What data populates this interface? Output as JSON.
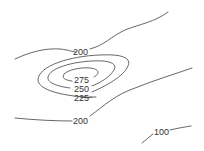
{
  "map": {
    "type": "contour",
    "line_color": "#555555",
    "label_color": "#333333",
    "contours": [
      {
        "level": "200",
        "label": "200",
        "position": "upper"
      },
      {
        "level": "275",
        "label": "275",
        "position": "center"
      },
      {
        "level": "250",
        "label": "250",
        "position": "center"
      },
      {
        "level": "225",
        "label": "225",
        "position": "center"
      },
      {
        "level": "200",
        "label": "200",
        "position": "lower"
      },
      {
        "level": "100",
        "label": "100",
        "position": "bottom-right"
      }
    ]
  }
}
